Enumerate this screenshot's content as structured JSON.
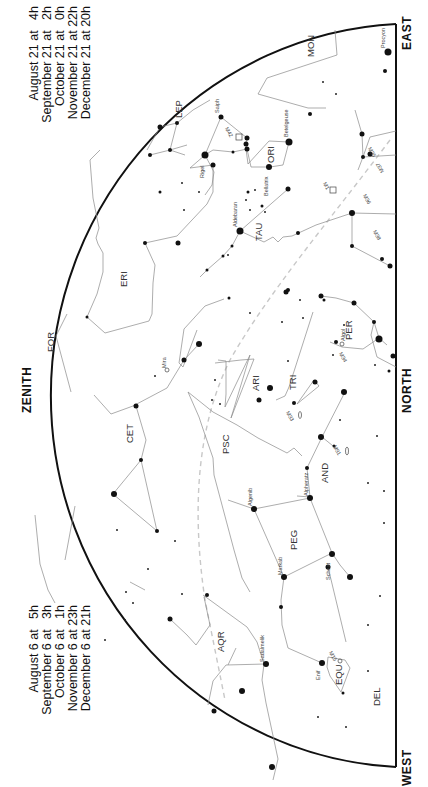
{
  "legend_left": {
    "lines": [
      "August 6 at   5h",
      "September 6 at   3h",
      "October 6 at   1h",
      "November 6 at 23h",
      "December 6 at 21h"
    ]
  },
  "legend_right": {
    "lines": [
      "August 21 at   4h",
      "September 21 at   2h",
      "October 21 at   0h",
      "November 21 at 22h",
      "December 21 at 20h"
    ]
  },
  "directions": {
    "zenith": "ZENITH",
    "north": "NORTH",
    "east": "EAST",
    "west": "WEST"
  },
  "constellations": {
    "mon": "MON",
    "lep": "LEP",
    "ori": "ORI",
    "tau": "TAU",
    "eri": "ERI",
    "for": "FOR",
    "per": "PER",
    "ari": "ARI",
    "tri": "TRI",
    "cet": "CET",
    "psc": "PSC",
    "and": "AND",
    "peg": "PEG",
    "aqr": "AQR",
    "equ": "EQU",
    "del": "DEL"
  },
  "stars": {
    "procyon": "Procyon",
    "saiph": "Saiph",
    "rigel": "Rigel",
    "betelgeuse": "Betelgeuse",
    "bellatrix": "Bellatrix",
    "aldebaran": "Aldebaran",
    "algol": "Algol",
    "mira": "Mira",
    "alpheratz": "Alpheratz",
    "algenib": "Algenib",
    "markab": "Markab",
    "scheat": "Scheat",
    "sadalmelik": "Sadalmelik",
    "enif": "Enif"
  },
  "deep_sky": {
    "m42": "M42",
    "m1": "M1",
    "m35": "M35",
    "m37": "M37",
    "m36": "M36",
    "m38": "M38",
    "m34": "M34",
    "m33": "M33",
    "m31": "M31",
    "m15": "M15"
  },
  "colors": {
    "horizon": "#111111",
    "lines": "#8a8a8a",
    "ecliptic": "#c8c8c8",
    "stars": "#111111"
  }
}
